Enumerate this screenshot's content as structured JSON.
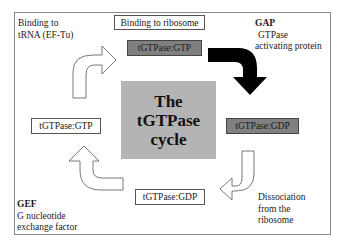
{
  "diagram": {
    "title_lines": [
      "The",
      "tGTPase",
      "cycle"
    ],
    "states": {
      "top": "tGTPase:GTP",
      "right": "tGTPase:GDP",
      "bottom": "tGTPase:GDP",
      "left": "tGTPase:GTP"
    },
    "steps": {
      "binding_ribosome": "Binding to ribosome",
      "binding_trna": [
        "Binding to",
        "tRNA (EF-Tu)"
      ],
      "dissociation": [
        "Dissociation",
        "from the",
        "ribosome"
      ]
    },
    "factors": {
      "gap": {
        "abbr": "GAP",
        "lines": [
          "GTPase",
          "activating protein"
        ]
      },
      "gef": {
        "abbr": "GEF",
        "lines": [
          "G nucleotide",
          "exchange factor"
        ]
      }
    },
    "colors": {
      "grey_state": "#808080",
      "center_box": "#b4b4b4",
      "gap_arrow": "#000000",
      "outline_arrow": "#ffffff"
    }
  }
}
